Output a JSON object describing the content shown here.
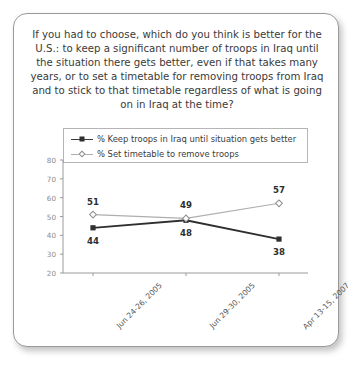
{
  "card": {
    "question": "If you had to choose, which do you think is better for the U.S.: to keep a significant number of troops in Iraq until the situation there gets better, even if that takes many years, or to set a timetable for removing troops from Iraq and to stick to that timetable regardless of what is going on in Iraq at the time?"
  },
  "chart_data": {
    "type": "line",
    "title": "",
    "xlabel": "",
    "ylabel": "",
    "ylim": [
      20,
      80
    ],
    "yticks": [
      20,
      30,
      40,
      50,
      60,
      70,
      80
    ],
    "grid": false,
    "legend_position": "top",
    "categories": [
      "Jun 24-26, 2005",
      "Jun 29-30, 2005",
      "Apr 13-15, 2007"
    ],
    "series": [
      {
        "name": "% Keep troops in Iraq until situation gets better",
        "values": [
          44,
          48,
          38
        ],
        "color": "#2f2f2f",
        "marker": "filled-square"
      },
      {
        "name": "% Set timetable to remove troops",
        "values": [
          51,
          49,
          57
        ],
        "color": "#aeaeae",
        "marker": "open-diamond"
      }
    ]
  }
}
